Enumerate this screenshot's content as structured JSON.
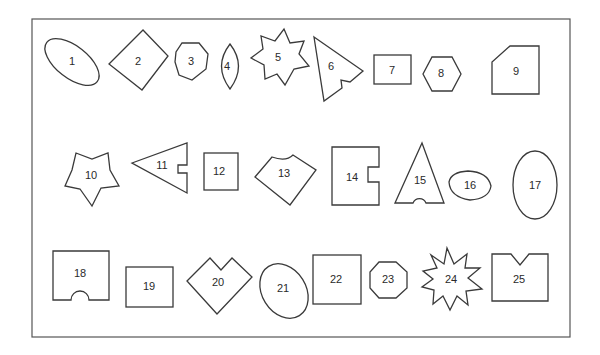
{
  "figure": {
    "title": "",
    "frame_color": "#555555",
    "stroke_color": "#3a3a3a",
    "shapes": [
      {
        "id": "1",
        "label": "1",
        "kind": "ellipse"
      },
      {
        "id": "2",
        "label": "2",
        "kind": "diamond"
      },
      {
        "id": "3",
        "label": "3",
        "kind": "octagon"
      },
      {
        "id": "4",
        "label": "4",
        "kind": "lens"
      },
      {
        "id": "5",
        "label": "5",
        "kind": "seven-point-star"
      },
      {
        "id": "6",
        "label": "6",
        "kind": "notched-triangle"
      },
      {
        "id": "7",
        "label": "7",
        "kind": "rectangle"
      },
      {
        "id": "8",
        "label": "8",
        "kind": "hexagon"
      },
      {
        "id": "9",
        "label": "9",
        "kind": "cut-corner-rectangle"
      },
      {
        "id": "10",
        "label": "10",
        "kind": "five-point-star"
      },
      {
        "id": "11",
        "label": "11",
        "kind": "notched-triangle"
      },
      {
        "id": "12",
        "label": "12",
        "kind": "square"
      },
      {
        "id": "13",
        "label": "13",
        "kind": "pentagon-with-concave-top"
      },
      {
        "id": "14",
        "label": "14",
        "kind": "notched-rectangle"
      },
      {
        "id": "15",
        "label": "15",
        "kind": "arched-triangle"
      },
      {
        "id": "16",
        "label": "16",
        "kind": "egg-shape"
      },
      {
        "id": "17",
        "label": "17",
        "kind": "ellipse"
      },
      {
        "id": "18",
        "label": "18",
        "kind": "arched-rectangle"
      },
      {
        "id": "19",
        "label": "19",
        "kind": "rectangle"
      },
      {
        "id": "20",
        "label": "20",
        "kind": "heart-diamond"
      },
      {
        "id": "21",
        "label": "21",
        "kind": "ellipse"
      },
      {
        "id": "22",
        "label": "22",
        "kind": "square"
      },
      {
        "id": "23",
        "label": "23",
        "kind": "octagon"
      },
      {
        "id": "24",
        "label": "24",
        "kind": "ten-point-star"
      },
      {
        "id": "25",
        "label": "25",
        "kind": "v-notched-rectangle"
      }
    ]
  }
}
